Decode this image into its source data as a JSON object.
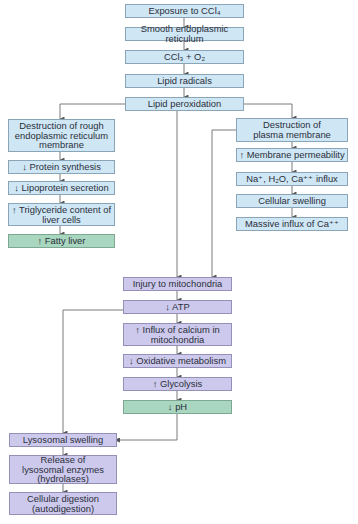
{
  "diagram": {
    "colors": {
      "initial_steps": "#cfe6f5",
      "mitochondrial_and_lysosomal_steps": "#cdc9ec",
      "outcome_highlight": "#a9d6bf",
      "connector": "#6b6b6b"
    },
    "top_chain": [
      {
        "id": "exposure",
        "label": "Exposure to CCl₄"
      },
      {
        "id": "ser",
        "label": "Smooth endoplasmic reticulum"
      },
      {
        "id": "ccl3",
        "label": "CCl₃ + O₂"
      },
      {
        "id": "lipid-radicals",
        "label": "Lipid radicals"
      },
      {
        "id": "lipid-peroxidation",
        "label": "Lipid peroxidation"
      }
    ],
    "left_branch": [
      {
        "id": "rer-destruction",
        "label": "Destruction of rough endoplasmic reticulum membrane"
      },
      {
        "id": "protein-synthesis",
        "label": "↓ Protein synthesis"
      },
      {
        "id": "lipoprotein-secretion",
        "label": "↓ Lipoprotein secretion"
      },
      {
        "id": "triglyceride",
        "label": "↑ Triglyceride content of liver cells"
      },
      {
        "id": "fatty-liver",
        "label": "↑ Fatty liver"
      }
    ],
    "right_branch": [
      {
        "id": "plasma-destruction",
        "label": "Destruction of plasma membrane"
      },
      {
        "id": "membrane-permeability",
        "label": "↑ Membrane permeability"
      },
      {
        "id": "ion-influx",
        "label": "Na⁺, H₂O, Ca⁺⁺ influx"
      },
      {
        "id": "cellular-swelling",
        "label": "Cellular swelling"
      },
      {
        "id": "massive-ca-influx",
        "label": "Massive influx of Ca⁺⁺"
      }
    ],
    "mitochondria_chain": [
      {
        "id": "mito-injury",
        "label": "Injury to mitochondria"
      },
      {
        "id": "atp",
        "label": "↓ ATP"
      },
      {
        "id": "calcium-influx",
        "label": "↑ Influx of calcium in mitochondria"
      },
      {
        "id": "oxidative",
        "label": "↓ Oxidative metabolism"
      },
      {
        "id": "glycolysis",
        "label": "↑ Glycolysis"
      },
      {
        "id": "ph",
        "label": "↓ pH"
      }
    ],
    "lysosome_chain": [
      {
        "id": "lysosomal-swelling",
        "label": "Lysosomal swelling"
      },
      {
        "id": "enzyme-release",
        "label": "Release of lysosomal enzymes (hydrolases)"
      },
      {
        "id": "digestion",
        "label": "Cellular digestion (autodigestion)"
      }
    ],
    "edges": [
      [
        "exposure",
        "ser"
      ],
      [
        "ser",
        "ccl3"
      ],
      [
        "ccl3",
        "lipid-radicals"
      ],
      [
        "lipid-radicals",
        "lipid-peroxidation"
      ],
      [
        "lipid-peroxidation",
        "rer-destruction"
      ],
      [
        "lipid-peroxidation",
        "plasma-destruction"
      ],
      [
        "lipid-peroxidation",
        "mito-injury"
      ],
      [
        "rer-destruction",
        "protein-synthesis"
      ],
      [
        "protein-synthesis",
        "lipoprotein-secretion"
      ],
      [
        "lipoprotein-secretion",
        "triglyceride"
      ],
      [
        "triglyceride",
        "fatty-liver"
      ],
      [
        "plasma-destruction",
        "membrane-permeability"
      ],
      [
        "membrane-permeability",
        "ion-influx"
      ],
      [
        "ion-influx",
        "cellular-swelling"
      ],
      [
        "cellular-swelling",
        "massive-ca-influx"
      ],
      [
        "plasma-destruction",
        "mito-injury"
      ],
      [
        "mito-injury",
        "atp"
      ],
      [
        "atp",
        "calcium-influx"
      ],
      [
        "calcium-influx",
        "oxidative"
      ],
      [
        "oxidative",
        "glycolysis"
      ],
      [
        "glycolysis",
        "ph"
      ],
      [
        "atp",
        "lysosomal-swelling"
      ],
      [
        "ph",
        "lysosomal-swelling"
      ],
      [
        "lysosomal-swelling",
        "enzyme-release"
      ],
      [
        "enzyme-release",
        "digestion"
      ]
    ]
  }
}
